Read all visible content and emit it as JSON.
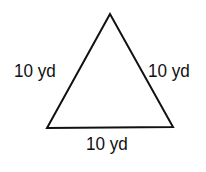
{
  "diagram": {
    "shape": "equilateral-triangle",
    "stroke_color": "#111111",
    "background": "#ffffff",
    "vertices": [
      [
        110,
        14
      ],
      [
        47,
        128
      ],
      [
        173,
        127
      ]
    ],
    "labels": {
      "left_side": "10 yd",
      "right_side": "10 yd",
      "bottom_side": "10 yd"
    }
  }
}
